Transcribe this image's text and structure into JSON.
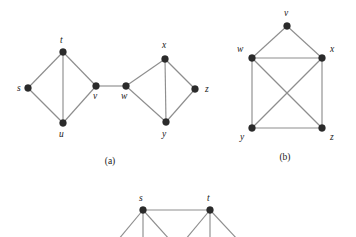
{
  "figure": {
    "background_color": "#ffffff",
    "edge_color": "#8e8e8e",
    "vertex_color": "#2b2b2b",
    "label_color": "#1a1a1a",
    "vertex_radius": 3.4,
    "captions": [
      {
        "id": "caption-a",
        "text": "(a)",
        "x": 110,
        "y": 164
      },
      {
        "id": "caption-b",
        "text": "(b)",
        "x": 285,
        "y": 160
      }
    ]
  },
  "graphs": [
    {
      "id": "graph-a",
      "caption": "(a)",
      "vertices": [
        {
          "id": "s",
          "label": "s",
          "x": 28,
          "y": 88,
          "lx": 17,
          "ly": 91
        },
        {
          "id": "t",
          "label": "t",
          "x": 63,
          "y": 52,
          "lx": 60,
          "ly": 43
        },
        {
          "id": "u",
          "label": "u",
          "x": 63,
          "y": 123,
          "lx": 59,
          "ly": 137
        },
        {
          "id": "v",
          "label": "v",
          "x": 96,
          "y": 86,
          "lx": 93,
          "ly": 99
        },
        {
          "id": "w",
          "label": "w",
          "x": 126,
          "y": 86,
          "lx": 121,
          "ly": 99
        },
        {
          "id": "x",
          "label": "x",
          "x": 165,
          "y": 59,
          "lx": 162,
          "ly": 48
        },
        {
          "id": "y",
          "label": "y",
          "x": 166,
          "y": 122,
          "lx": 162,
          "ly": 137
        },
        {
          "id": "z",
          "label": "z",
          "x": 195,
          "y": 89,
          "lx": 205,
          "ly": 92
        }
      ],
      "edges": [
        [
          "s",
          "t"
        ],
        [
          "s",
          "u"
        ],
        [
          "t",
          "u"
        ],
        [
          "t",
          "v"
        ],
        [
          "u",
          "v"
        ],
        [
          "v",
          "w"
        ],
        [
          "w",
          "x"
        ],
        [
          "w",
          "y"
        ],
        [
          "x",
          "y"
        ],
        [
          "x",
          "z"
        ],
        [
          "y",
          "z"
        ]
      ]
    },
    {
      "id": "graph-b",
      "caption": "(b)",
      "vertices": [
        {
          "id": "v",
          "label": "v",
          "x": 287,
          "y": 26,
          "lx": 284,
          "ly": 16
        },
        {
          "id": "w",
          "label": "w",
          "x": 252,
          "y": 58,
          "lx": 237,
          "ly": 52
        },
        {
          "id": "x",
          "label": "x",
          "x": 322,
          "y": 58,
          "lx": 330,
          "ly": 52
        },
        {
          "id": "y",
          "label": "y",
          "x": 252,
          "y": 128,
          "lx": 240,
          "ly": 140
        },
        {
          "id": "z",
          "label": "z",
          "x": 322,
          "y": 128,
          "lx": 330,
          "ly": 140
        }
      ],
      "edges": [
        [
          "v",
          "w"
        ],
        [
          "v",
          "x"
        ],
        [
          "w",
          "x"
        ],
        [
          "w",
          "y"
        ],
        [
          "w",
          "z"
        ],
        [
          "x",
          "y"
        ],
        [
          "x",
          "z"
        ],
        [
          "y",
          "z"
        ]
      ]
    },
    {
      "id": "graph-c",
      "caption": "",
      "note": "partially cropped at bottom of image",
      "vertices": [
        {
          "id": "s",
          "label": "s",
          "x": 143,
          "y": 210,
          "lx": 139,
          "ly": 201
        },
        {
          "id": "t",
          "label": "t",
          "x": 210,
          "y": 210,
          "lx": 207,
          "ly": 201
        }
      ],
      "edges": [
        [
          "s",
          "t"
        ]
      ],
      "pendant_edges": [
        {
          "from": "s",
          "to_x": 118,
          "to_y": 240
        },
        {
          "from": "s",
          "to_x": 143,
          "to_y": 240
        },
        {
          "from": "s",
          "to_x": 170,
          "to_y": 240
        },
        {
          "from": "t",
          "to_x": 185,
          "to_y": 240
        },
        {
          "from": "t",
          "to_x": 210,
          "to_y": 240
        },
        {
          "from": "t",
          "to_x": 238,
          "to_y": 240
        }
      ]
    }
  ]
}
